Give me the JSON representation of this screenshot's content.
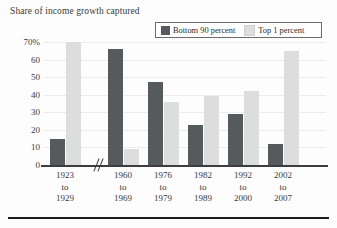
{
  "chart_data": {
    "type": "bar",
    "title": "Share of income growth captured",
    "xlabel": "",
    "ylabel": "",
    "ylim": [
      0,
      70
    ],
    "yticks": [
      "70%",
      "60",
      "50",
      "40",
      "30",
      "20",
      "10",
      "0"
    ],
    "ytick_values": [
      70,
      60,
      50,
      40,
      30,
      20,
      10,
      0
    ],
    "grid": true,
    "legend_position": "top-right",
    "axis_break_after_category": 0,
    "categories": [
      {
        "line1": "1923",
        "line2": "to",
        "line3": "1929"
      },
      {
        "line1": "1960",
        "line2": "to",
        "line3": "1969"
      },
      {
        "line1": "1976",
        "line2": "to",
        "line3": "1979"
      },
      {
        "line1": "1982",
        "line2": "to",
        "line3": "1989"
      },
      {
        "line1": "1992",
        "line2": "to",
        "line3": "2000"
      },
      {
        "line1": "2002",
        "line2": "to",
        "line3": "2007"
      }
    ],
    "series": [
      {
        "name": "Bottom 90 percent",
        "color": "#555a5d",
        "values": [
          15,
          66,
          47,
          23,
          29,
          12
        ]
      },
      {
        "name": "Top 1 percent",
        "color": "#dcdedd",
        "values": [
          70,
          9,
          36,
          39,
          42,
          65
        ]
      }
    ]
  },
  "legend": {
    "items": [
      {
        "label": "Bottom 90 percent",
        "color": "#555a5d"
      },
      {
        "label": "Top 1 percent",
        "color": "#dcdedd"
      }
    ]
  }
}
